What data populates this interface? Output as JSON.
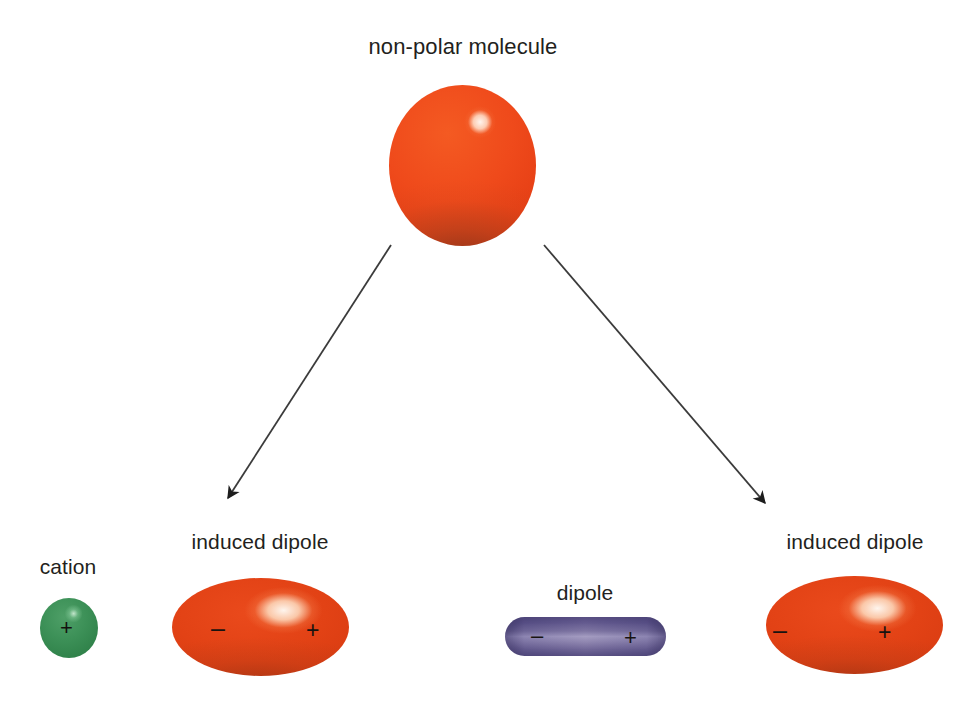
{
  "figure": {
    "background_color": "#ffffff",
    "width": 962,
    "height": 715
  },
  "labels": {
    "nonpolar_molecule": "non-polar molecule",
    "cation": "cation",
    "induced_dipole_left": "induced dipole",
    "dipole": "dipole",
    "induced_dipole_right": "induced dipole"
  },
  "charges": {
    "cation_plus": "+",
    "induced_left_minus": "–",
    "induced_left_plus": "+",
    "dipole_minus": "–",
    "dipole_plus": "+",
    "induced_right_minus": "–",
    "induced_right_plus": "+"
  },
  "colors": {
    "nonpolar_sphere": "#e8421a",
    "induced_dipole": "#dc3e14",
    "cation_sphere": "#2f8149",
    "dipole_capsule": "#9a93bc",
    "arrow": "#3b3b3b",
    "text": "#231f20",
    "background": "#ffffff"
  },
  "shapes": {
    "nonpolar_sphere": {
      "name": "non-polar molecule sphere",
      "cx": 462,
      "cy": 165,
      "rx": 73,
      "ry": 80,
      "highlight": {
        "cx": 480,
        "cy": 122,
        "r": 11
      }
    },
    "cation_sphere": {
      "name": "cation sphere",
      "cx": 69,
      "cy": 628,
      "rx": 29,
      "ry": 30
    },
    "induced_dipole_left": {
      "name": "left induced dipole ellipse",
      "cx": 260,
      "cy": 627,
      "rx": 88,
      "ry": 49,
      "highlight": {
        "cx": 284,
        "cy": 610
      }
    },
    "induced_dipole_right": {
      "name": "right induced dipole ellipse",
      "cx": 855,
      "cy": 625,
      "rx": 88,
      "ry": 49,
      "highlight": {
        "cx": 879,
        "cy": 608
      }
    },
    "dipole_capsule": {
      "name": "permanent dipole capsule",
      "x": 505,
      "y": 617,
      "width": 161,
      "height": 39,
      "radius": 20
    }
  },
  "arrows": [
    {
      "name": "arrow-to-left-induced-dipole",
      "from": {
        "x": 391,
        "y": 245
      },
      "to": {
        "x": 222,
        "y": 508
      },
      "color": "#3b3b3b",
      "width": 1.8
    },
    {
      "name": "arrow-to-right-induced-dipole",
      "from": {
        "x": 544,
        "y": 245
      },
      "to": {
        "x": 772,
        "y": 512
      },
      "color": "#3b3b3b",
      "width": 1.8
    }
  ]
}
